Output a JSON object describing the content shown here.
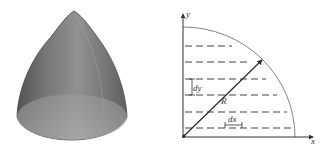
{
  "figure": {
    "left_panel": {
      "description": "3D paraboloid / bullet-shaped solid rendered in translucent gray",
      "fill_color": "#7a7a7a",
      "highlight_color": "#b0b0b0",
      "base_color": "#a8a8a8"
    },
    "right_panel": {
      "description": "Quarter-circle cross-section with horizontal dashed strips",
      "axis_labels": {
        "x": "x",
        "y": "y"
      },
      "labels": {
        "radius": "R",
        "strip_height": "dy",
        "strip_width": "dx"
      },
      "dashed_line_count": 6,
      "line_color": "#333333",
      "arc_color": "#666666"
    }
  }
}
